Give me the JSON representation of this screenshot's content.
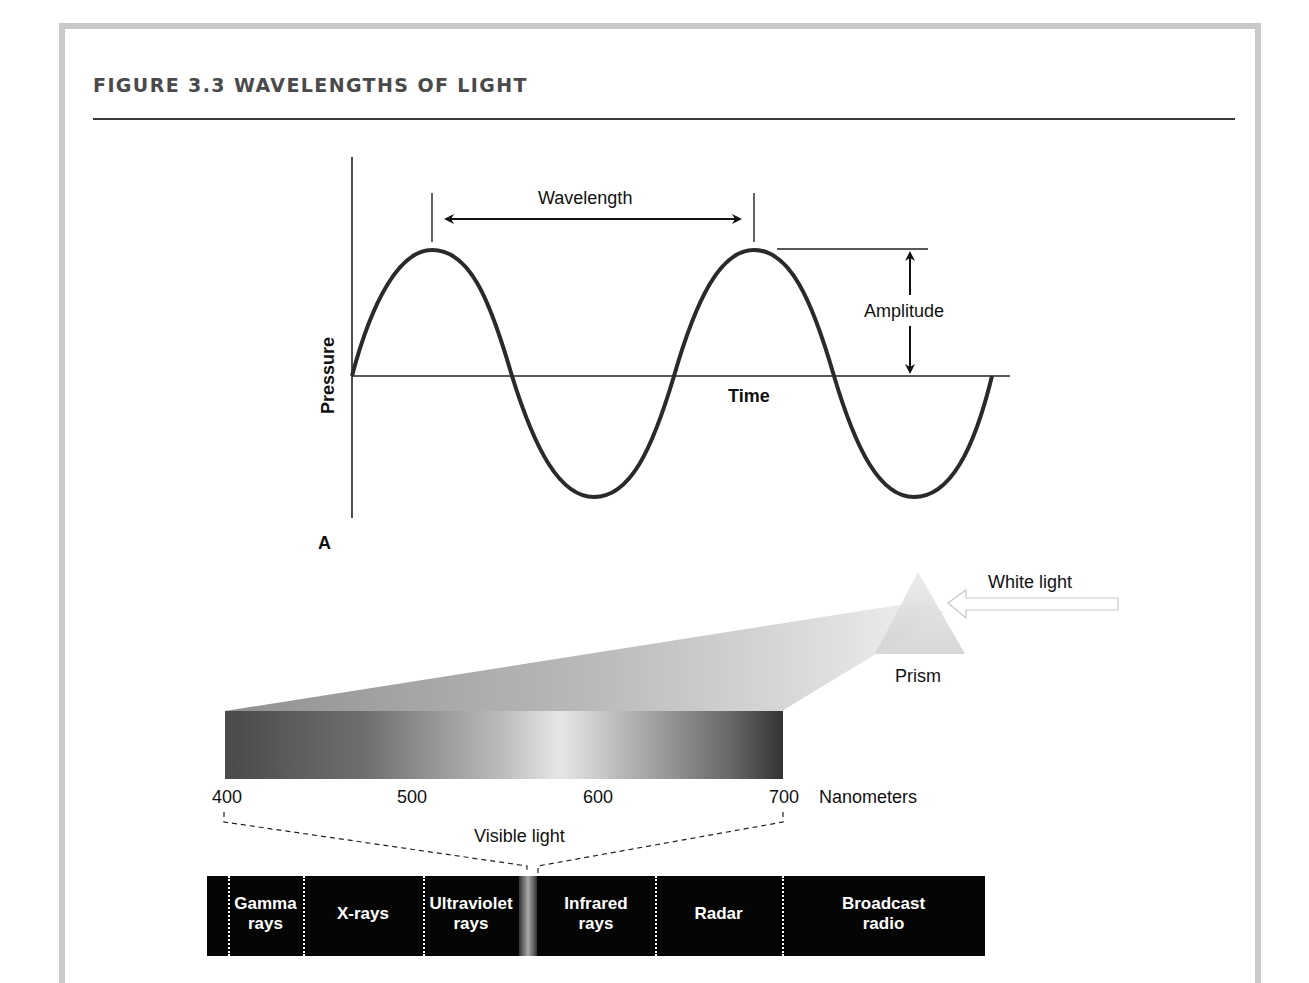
{
  "figure": {
    "title": "FIGURE 3.3   WAVELENGTHS OF LIGHT"
  },
  "panel_a": {
    "label": "A",
    "y_axis_label": "Pressure",
    "x_axis_label": "Time",
    "wavelength_label": "Wavelength",
    "amplitude_label": "Amplitude"
  },
  "panel_b": {
    "white_light_label": "White light",
    "prism_label": "Prism",
    "scale_ticks": [
      "400",
      "500",
      "600",
      "700"
    ],
    "scale_unit": "Nanometers",
    "visible_light_label": "Visible light",
    "spectrum_bands": [
      {
        "line1": "Gamma",
        "line2": "rays"
      },
      {
        "line1": "X-rays",
        "line2": ""
      },
      {
        "line1": "Ultraviolet",
        "line2": "rays"
      },
      {
        "line1": "Infrared",
        "line2": "rays"
      },
      {
        "line1": "Radar",
        "line2": ""
      },
      {
        "line1": "Broadcast",
        "line2": "radio"
      }
    ]
  },
  "colors": {
    "frame_border": "#c9c9c9",
    "title_text": "#4a4a4a",
    "band_background": "#050505",
    "wave_stroke": "#2a2a2a"
  }
}
